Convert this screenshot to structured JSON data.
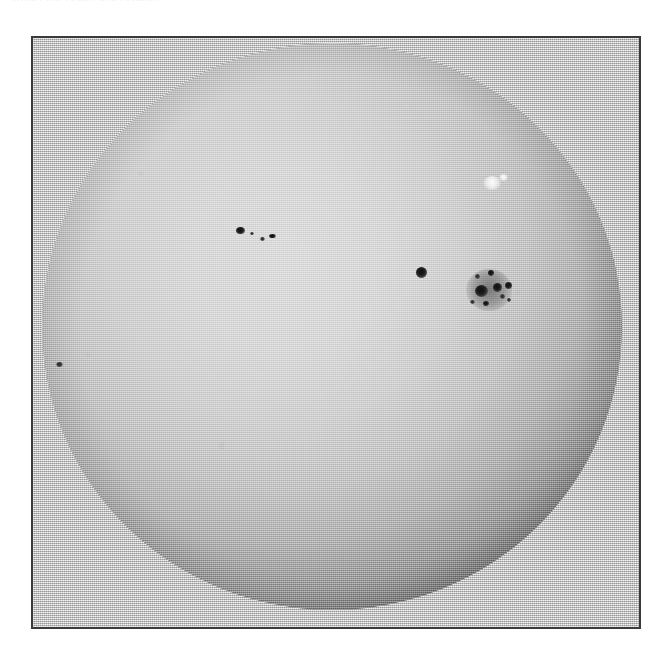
{
  "page": {
    "width": 670,
    "height": 648,
    "background_color": "#ffffff",
    "caption_top_partial": "which the reach this rotation"
  },
  "frame": {
    "name": "photographic-plate-frame",
    "left": 31,
    "top": 36,
    "width": 610,
    "height": 593,
    "border_color": "#3a3a3a",
    "border_width": 2,
    "plate_color": "#c9c9c9"
  },
  "image": {
    "subject": "solar-disk-white-light-photograph",
    "medium": "halftone-printed-photograph",
    "palette": {
      "paper": "#c9c9c9",
      "disk_center": "#d6d6d6",
      "disk_mid": "#bcbcbc",
      "limb_dark": "#141414",
      "umbra": "#101010",
      "facula": "#ffffff",
      "frame_border": "#3a3a3a"
    },
    "disk": {
      "center_x": 332,
      "center_y": 327,
      "radius": 290,
      "limb_darkening": true,
      "bright_core_offset": "42% 38%"
    }
  },
  "features": [
    {
      "id": "spot-nw-a",
      "type": "sunspot",
      "label": "northwest sunspot A",
      "x": 240,
      "y": 230,
      "w": 9,
      "h": 7,
      "style": "sunspot"
    },
    {
      "id": "spot-nw-b",
      "type": "sunspot",
      "label": "northwest sunspot B",
      "x": 262,
      "y": 239,
      "w": 5,
      "h": 4,
      "style": "sunspot-soft"
    },
    {
      "id": "spot-nw-c",
      "type": "sunspot",
      "label": "northwest sunspot C",
      "x": 272,
      "y": 236,
      "w": 7,
      "h": 4,
      "style": "sunspot"
    },
    {
      "id": "spot-nw-d",
      "type": "sunspot",
      "label": "northwest sunspot D",
      "x": 252,
      "y": 233,
      "w": 4,
      "h": 3,
      "style": "sunspot-soft"
    },
    {
      "id": "spot-isolated",
      "type": "sunspot",
      "label": "isolated round sunspot",
      "x": 421,
      "y": 272,
      "w": 11,
      "h": 11,
      "style": "sunspot"
    },
    {
      "id": "group-penumbra",
      "type": "penumbra",
      "label": "main group penumbral halo",
      "x": 489,
      "y": 290,
      "w": 46,
      "h": 42,
      "style": "penumbra"
    },
    {
      "id": "spot-main-1",
      "type": "sunspot",
      "label": "main group leader spot",
      "x": 481,
      "y": 291,
      "w": 13,
      "h": 12,
      "style": "sunspot"
    },
    {
      "id": "spot-main-2",
      "type": "sunspot",
      "label": "main group follower spot",
      "x": 497,
      "y": 287,
      "w": 9,
      "h": 9,
      "style": "sunspot"
    },
    {
      "id": "spot-main-3",
      "type": "sunspot",
      "label": "main group spot 3",
      "x": 508,
      "y": 285,
      "w": 7,
      "h": 7,
      "style": "sunspot"
    },
    {
      "id": "spot-main-4",
      "type": "sunspot",
      "label": "main group spot 4",
      "x": 491,
      "y": 273,
      "w": 6,
      "h": 6,
      "style": "sunspot"
    },
    {
      "id": "spot-main-5",
      "type": "sunspot",
      "label": "main group spot 5",
      "x": 477,
      "y": 276,
      "w": 5,
      "h": 5,
      "style": "sunspot-soft"
    },
    {
      "id": "spot-main-6",
      "type": "sunspot",
      "label": "main group spot 6",
      "x": 502,
      "y": 296,
      "w": 5,
      "h": 5,
      "style": "sunspot-soft"
    },
    {
      "id": "spot-main-7",
      "type": "sunspot",
      "label": "main group spot 7",
      "x": 486,
      "y": 303,
      "w": 6,
      "h": 5,
      "style": "sunspot"
    },
    {
      "id": "spot-main-8",
      "type": "sunspot",
      "label": "main group spot 8",
      "x": 472,
      "y": 302,
      "w": 5,
      "h": 4,
      "style": "sunspot-soft"
    },
    {
      "id": "spot-main-9",
      "type": "sunspot",
      "label": "main group spot 9",
      "x": 509,
      "y": 300,
      "w": 4,
      "h": 4,
      "style": "sunspot-soft"
    },
    {
      "id": "spot-limb-west",
      "type": "sunspot",
      "label": "small spot near west limb",
      "x": 59,
      "y": 364,
      "w": 7,
      "h": 5,
      "style": "sunspot-soft"
    },
    {
      "id": "facula-ne",
      "type": "facula",
      "label": "bright facula / plage patch",
      "x": 492,
      "y": 183,
      "w": 18,
      "h": 14,
      "style": "facula"
    },
    {
      "id": "facula-ne-2",
      "type": "facula",
      "label": "secondary facular brightening",
      "x": 503,
      "y": 177,
      "w": 9,
      "h": 7,
      "style": "facula"
    }
  ]
}
